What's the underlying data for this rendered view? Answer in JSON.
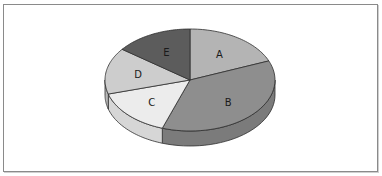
{
  "chart_data": {
    "type": "pie",
    "style": "3d",
    "title": "",
    "categories": [
      "A",
      "B",
      "C",
      "D",
      "E"
    ],
    "values": [
      19,
      36,
      15,
      15,
      15
    ],
    "colors": {
      "A": "#b4b4b4",
      "B": "#8e8e8e",
      "C": "#ececec",
      "D": "#cdcdcd",
      "E": "#5c5c5c"
    },
    "side_colors": {
      "B": "#7b7b7b",
      "C": "#d6d6d6",
      "D": "#b8b8b8"
    },
    "legend": "none",
    "labels_inside": true,
    "start_angle_deg": -90,
    "boundary_angles_deg": [
      -90,
      -22,
      109,
      164,
      217,
      270
    ]
  }
}
